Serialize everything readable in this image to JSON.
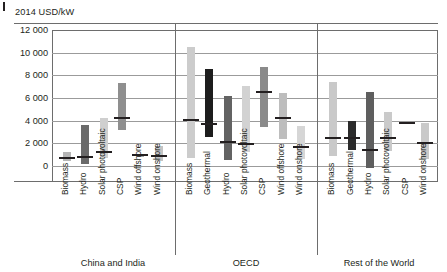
{
  "figure": {
    "unit_label": "2014 USD/kW",
    "corner_tick": "corner-tick-mark"
  },
  "chart_data": {
    "type": "bar",
    "subtype": "range-with-median",
    "title": "",
    "subtitle": "",
    "xlabel": "",
    "ylabel": "2014 USD/kW",
    "ylim": [
      0,
      12000
    ],
    "ytick_labels": [
      "12 000",
      "10 000",
      "8 000",
      "6 000",
      "4 000",
      "2 000",
      "0"
    ],
    "ytick_values": [
      12000,
      10000,
      8000,
      6000,
      4000,
      2000,
      0
    ],
    "grid": true,
    "legend": "none",
    "groups": [
      {
        "name": "China and India",
        "categories": [
          {
            "label": "Biomass",
            "low": 400,
            "high": 1200,
            "median": 750,
            "color": "#b5b5b5"
          },
          {
            "label": "Hydro",
            "low": 150,
            "high": 3600,
            "median": 800,
            "color": "#6a6a6a"
          },
          {
            "label": "Solar photovoltaic",
            "low": 700,
            "high": 4200,
            "median": 1200,
            "color": "#cfcfcf"
          },
          {
            "label": "CSP",
            "low": 3200,
            "high": 7300,
            "median": 4200,
            "color": "#8f8f8f"
          },
          {
            "label": "Wind offshore",
            "low": 800,
            "high": 1050,
            "median": 950,
            "color": "#a8a8a8"
          },
          {
            "label": "Wind onshore",
            "low": 400,
            "high": 1800,
            "median": 850,
            "color": "#c4c4c4"
          }
        ]
      },
      {
        "name": "OECD",
        "categories": [
          {
            "label": "Biomass",
            "low": 700,
            "high": 10500,
            "median": 4100,
            "color": "#cccccc"
          },
          {
            "label": "Geothermal",
            "low": 2600,
            "high": 8600,
            "median": 3750,
            "color": "#1d1d1d"
          },
          {
            "label": "Hydro",
            "low": 500,
            "high": 6200,
            "median": 2150,
            "color": "#636363"
          },
          {
            "label": "Solar photovoltaic",
            "low": 1200,
            "high": 7100,
            "median": 1950,
            "color": "#d2d2d2"
          },
          {
            "label": "CSP",
            "low": 3400,
            "high": 8700,
            "median": 6500,
            "color": "#8a8a8a"
          },
          {
            "label": "Wind offshore",
            "low": 2400,
            "high": 6400,
            "median": 4250,
            "color": "#bdbdbd"
          },
          {
            "label": "Wind onshore",
            "low": 600,
            "high": 3500,
            "median": 1650,
            "color": "#d6d6d6"
          }
        ]
      },
      {
        "name": "Rest of the World",
        "categories": [
          {
            "label": "Biomass",
            "low": 900,
            "high": 7400,
            "median": 2450,
            "color": "#c9c9c9"
          },
          {
            "label": "Geothermal",
            "low": 1400,
            "high": 4000,
            "median": 2500,
            "color": "#2b2b2b"
          },
          {
            "label": "Hydro",
            "low": -200,
            "high": 6500,
            "median": 1450,
            "color": "#5e5e5e"
          },
          {
            "label": "Solar photovoltaic",
            "low": 1300,
            "high": 4800,
            "median": 2500,
            "color": "#cacaca"
          },
          {
            "label": "CSP",
            "low": 3700,
            "high": 3900,
            "median": 3800,
            "color": "#9e9e9e"
          },
          {
            "label": "Wind onshore",
            "low": 600,
            "high": 3800,
            "median": 2050,
            "color": "#c9c9c9"
          }
        ]
      }
    ]
  }
}
